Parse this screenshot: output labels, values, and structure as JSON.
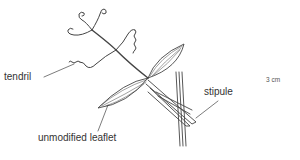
{
  "diagram": {
    "labels": {
      "tendril": "tendril",
      "stipule": "stipule",
      "unmodified_leaflet": "unmodified leaflet",
      "scale": "3 cm"
    },
    "colors": {
      "line": "#444444",
      "text": "#333333",
      "background": "#ffffff"
    }
  }
}
